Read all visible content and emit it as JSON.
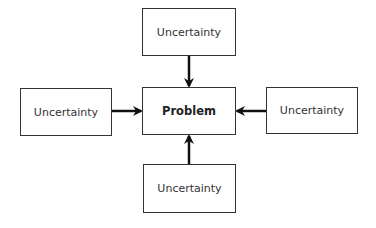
{
  "diagram": {
    "center": {
      "label": "Problem"
    },
    "nodes": [
      {
        "id": "top",
        "label": "Uncertainty"
      },
      {
        "id": "left",
        "label": "Uncertainty"
      },
      {
        "id": "right",
        "label": "Uncertainty"
      },
      {
        "id": "bottom",
        "label": "Uncertainty"
      }
    ],
    "edges": [
      {
        "from": "top",
        "to": "center"
      },
      {
        "from": "left",
        "to": "center"
      },
      {
        "from": "right",
        "to": "center"
      },
      {
        "from": "bottom",
        "to": "center"
      }
    ],
    "colors": {
      "stroke": "#333333",
      "arrow": "#111111",
      "background": "#ffffff"
    }
  }
}
